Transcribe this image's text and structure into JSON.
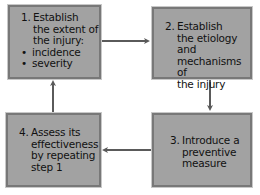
{
  "diagram": {
    "type": "cycle",
    "colors": {
      "box_fill": "#a2a2a2",
      "box_border": "#787878",
      "arrow": "#5a5a5a",
      "text": "#111111"
    },
    "steps": [
      {
        "number": "1.",
        "lines": [
          "Establish",
          "the extent of",
          "the injury:"
        ],
        "bullets": [
          "incidence",
          "severity"
        ]
      },
      {
        "number": "2.",
        "lines": [
          "Establish",
          "the etiology and",
          "mechanisms of",
          "the injury"
        ]
      },
      {
        "number": "3.",
        "lines": [
          "Introduce a",
          "preventive",
          "measure"
        ]
      },
      {
        "number": "4.",
        "lines": [
          "Assess its",
          "effectiveness",
          "by repeating",
          "step 1"
        ]
      }
    ],
    "edges": [
      {
        "from": 1,
        "to": 2,
        "direction": "right"
      },
      {
        "from": 2,
        "to": 3,
        "direction": "down"
      },
      {
        "from": 3,
        "to": 4,
        "direction": "left"
      },
      {
        "from": 4,
        "to": 1,
        "direction": "up"
      }
    ]
  }
}
